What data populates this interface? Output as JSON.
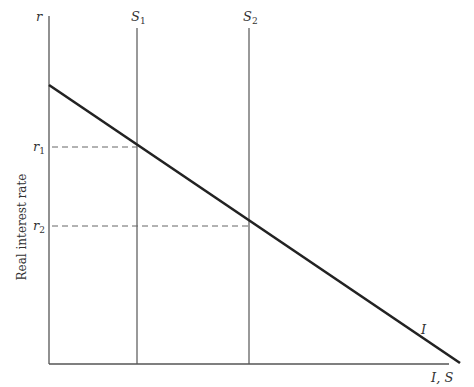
{
  "diagram": {
    "type": "savings-investment",
    "y_axis": {
      "label_short": "r",
      "label_long": "Real interest rate"
    },
    "x_axis": {
      "label": "I, S"
    },
    "curves": [
      {
        "name": "I",
        "label": "I",
        "kind": "downward-sloping investment curve"
      },
      {
        "name": "S1",
        "label": "S",
        "subscript": "1",
        "kind": "vertical saving line"
      },
      {
        "name": "S2",
        "label": "S",
        "subscript": "2",
        "kind": "vertical saving line"
      }
    ],
    "equilibria": [
      {
        "label": "r",
        "subscript": "1",
        "at": "I ∩ S1"
      },
      {
        "label": "r",
        "subscript": "2",
        "at": "I ∩ S2"
      }
    ],
    "colors": {
      "axis": "#555555",
      "curve": "#222222",
      "dashed": "#666666"
    }
  }
}
